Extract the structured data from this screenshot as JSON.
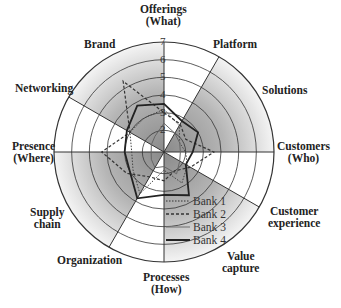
{
  "chart_data": {
    "type": "radar",
    "title": "",
    "axes": [
      "Offerings (What)",
      "Platform",
      "Solutions",
      "Customers (Who)",
      "Customer experience",
      "Value capture",
      "Processes (How)",
      "Organization",
      "Supply chain",
      "Presence (Where)",
      "Networking",
      "Brand"
    ],
    "rlim": [
      1,
      7
    ],
    "rticks": [
      1,
      2,
      3,
      4,
      5,
      6,
      7
    ],
    "series": [
      {
        "name": "Bank 1",
        "style": "dotted",
        "values": [
          3.2,
          2.5,
          1.8,
          2.0,
          2.3,
          2.8,
          1.8,
          3.5,
          2.8,
          2.6,
          3.0,
          3.0
        ]
      },
      {
        "name": "Bank 2",
        "style": "dashed",
        "values": [
          3.0,
          2.6,
          2.2,
          3.6,
          2.5,
          2.0,
          2.4,
          2.4,
          3.2,
          4.3,
          3.0,
          5.4
        ]
      },
      {
        "name": "Bank 3",
        "style": "thin-solid",
        "values": [
          2.4,
          2.0,
          1.8,
          1.7,
          1.8,
          2.2,
          1.6,
          1.8,
          1.6,
          1.5,
          1.6,
          1.8
        ]
      },
      {
        "name": "Bank 4",
        "style": "thick-solid",
        "values": [
          3.5,
          2.8,
          3.0,
          2.4,
          2.2,
          3.6,
          3.2,
          3.8,
          3.0,
          3.0,
          3.2,
          3.8
        ]
      }
    ],
    "shaded_sectors_deg": [
      [
        90,
        150
      ],
      [
        0,
        60
      ],
      [
        -90,
        -30
      ],
      [
        -180,
        -120
      ]
    ],
    "sector_lines_deg": [
      90,
      60,
      0,
      -30,
      -90,
      -120,
      180,
      150
    ],
    "grid": true,
    "legend_position": "lower-center-right"
  },
  "labels": {
    "offerings": [
      "Offerings",
      "(What)"
    ],
    "platform": "Platform",
    "solutions": "Solutions",
    "customers": [
      "Customers",
      "(Who)"
    ],
    "customer_experience": [
      "Customer",
      "experience"
    ],
    "value_capture": [
      "Value",
      "capture"
    ],
    "processes": [
      "Processes",
      "(How)"
    ],
    "organization": "Organization",
    "supply_chain": [
      "Supply",
      "chain"
    ],
    "presence": [
      "Presence",
      "(Where)"
    ],
    "networking": "Networking",
    "brand": "Brand"
  },
  "ticks": [
    "1",
    "2",
    "3",
    "4",
    "5",
    "6",
    "7"
  ],
  "legend": [
    "Bank 1",
    "Bank 2",
    "Bank 3",
    "Bank 4"
  ]
}
